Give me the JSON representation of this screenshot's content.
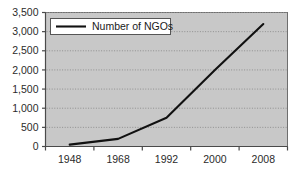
{
  "chart_data": {
    "type": "line",
    "title": "",
    "xlabel": "",
    "ylabel": "",
    "categories": [
      "1948",
      "1968",
      "1992",
      "2000",
      "2008"
    ],
    "series": [
      {
        "name": "Number of NGOs",
        "values": [
          50,
          200,
          750,
          2000,
          3200
        ]
      }
    ],
    "x_tick_labels": [
      "1948",
      "1968",
      "1992",
      "2000",
      "2008"
    ],
    "y_tick_labels": [
      "0",
      "500",
      "1,000",
      "1,500",
      "2,000",
      "2,500",
      "3,000",
      "3,500"
    ],
    "y_tick_values": [
      0,
      500,
      1000,
      1500,
      2000,
      2500,
      3000,
      3500
    ],
    "ylim": [
      0,
      3500
    ],
    "grid": true,
    "grid_style": "dotted-horizontal",
    "legend": {
      "position": "top-left",
      "entries": [
        {
          "label": "Number of NGOs",
          "marker": "line",
          "color": "#111111"
        }
      ]
    },
    "colors": {
      "plot_background": "#c8c8c8",
      "page_background": "#ffffff",
      "series_line": "#111111",
      "axis": "#555555",
      "gridline": "#8f8f8f",
      "tick_text": "#2b2b2b",
      "legend_background": "#ffffff",
      "legend_border": "#555555"
    }
  }
}
